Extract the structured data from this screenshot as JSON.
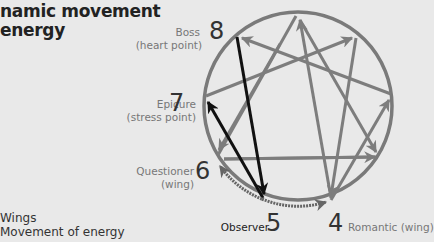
{
  "title": {
    "line1": "namic movement",
    "line2": "energy"
  },
  "points": [
    {
      "number": "8",
      "label": "Boss",
      "sublabel": "(heart point)"
    },
    {
      "number": "7",
      "label": "Epicure",
      "sublabel": "(stress point)"
    },
    {
      "number": "6",
      "label": "Questioner",
      "sublabel": "(wing)"
    },
    {
      "number": "5",
      "label": "Observer",
      "sublabel": ""
    },
    {
      "number": "4",
      "label": "Romantic (wing)",
      "sublabel": ""
    }
  ],
  "legend": {
    "items": [
      {
        "label": "Wings"
      },
      {
        "label": "Movement of energy"
      }
    ]
  },
  "colors": {
    "background": "#e9e9e9",
    "circle": "#7a7a7a",
    "lines": "#7d7d7d",
    "highlight": "#111111",
    "wing_arc": "#666666"
  }
}
